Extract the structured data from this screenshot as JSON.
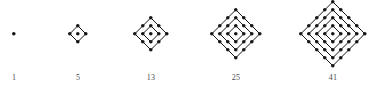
{
  "figure": {
    "background_color": "#ffffff",
    "dot_color": "#16161a",
    "label_color": "#4a4a4e",
    "dot_radius": 1.8,
    "ring_spacing": 8,
    "baseline_y": 34,
    "label_y": 73,
    "items": [
      {
        "label": "1",
        "rings": 1,
        "center_x": 14,
        "dot_count": 1
      },
      {
        "label": "5",
        "rings": 2,
        "center_x": 78,
        "dot_count": 5
      },
      {
        "label": "13",
        "rings": 3,
        "center_x": 151,
        "dot_count": 13
      },
      {
        "label": "25",
        "rings": 4,
        "center_x": 236,
        "dot_count": 25
      },
      {
        "label": "41",
        "rings": 5,
        "center_x": 333,
        "dot_count": 41
      }
    ]
  },
  "chart_data": {
    "type": "scatter",
    "title": "",
    "subtitle": "",
    "xlabel": "",
    "ylabel": "",
    "grid": false,
    "legend_position": "none",
    "categories": [
      "1",
      "5",
      "13",
      "25",
      "41"
    ],
    "values": [
      1,
      5,
      13,
      25,
      41
    ],
    "annotations": [
      "1",
      "5",
      "13",
      "25",
      "41"
    ],
    "series": [
      {
        "name": "centered square numbers",
        "values": [
          1,
          5,
          13,
          25,
          41
        ]
      },
      {
        "name": "rings per figure",
        "values": [
          1,
          2,
          3,
          4,
          5
        ]
      }
    ]
  }
}
